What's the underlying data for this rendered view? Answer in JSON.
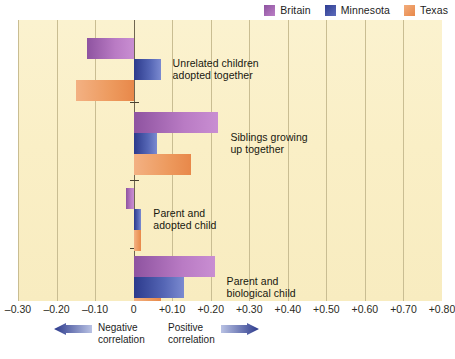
{
  "legend": {
    "items": [
      {
        "label": "Britain",
        "color": "#a962b5",
        "icon": "legend-swatch-britain"
      },
      {
        "label": "Minnesota",
        "color": "#4456ab",
        "icon": "legend-swatch-minnesota"
      },
      {
        "label": "Texas",
        "color": "#ee9a5c",
        "icon": "legend-swatch-texas"
      }
    ]
  },
  "axis": {
    "ticks": [
      "–0.30",
      "–0.20",
      "–0.10",
      "0",
      "+0.10",
      "+0.20",
      "+0.30",
      "+0.40",
      "+0.50",
      "+0.60",
      "+0.70",
      "+0.80"
    ],
    "min": -0.3,
    "max": 0.8,
    "step": 0.1
  },
  "direction": {
    "negative": "Negative\ncorrelation",
    "positive": "Positive\ncorrelation"
  },
  "groups": [
    {
      "label": "Unrelated children\nadopted together"
    },
    {
      "label": "Siblings growing\nup together"
    },
    {
      "label": "Parent and\nadopted child"
    },
    {
      "label": "Parent and\nbiological child"
    }
  ],
  "chart_data": {
    "type": "bar",
    "orientation": "horizontal",
    "title": "",
    "xlabel": "Correlation",
    "ylabel": "",
    "xlim": [
      -0.3,
      0.8
    ],
    "xticks": [
      -0.3,
      -0.2,
      -0.1,
      0,
      0.1,
      0.2,
      0.3,
      0.4,
      0.5,
      0.6,
      0.7,
      0.8
    ],
    "grid": true,
    "legend_position": "top-right",
    "categories": [
      "Unrelated children adopted together",
      "Siblings growing up together",
      "Parent and adopted child",
      "Parent and biological child"
    ],
    "series": [
      {
        "name": "Britain",
        "color": "#a962b5",
        "values": [
          -0.12,
          0.22,
          -0.02,
          0.21
        ]
      },
      {
        "name": "Minnesota",
        "color": "#4456ab",
        "values": [
          0.07,
          0.06,
          0.02,
          0.13
        ]
      },
      {
        "name": "Texas",
        "color": "#ee9a5c",
        "values": [
          -0.15,
          0.15,
          0.02,
          0.07
        ]
      }
    ]
  }
}
